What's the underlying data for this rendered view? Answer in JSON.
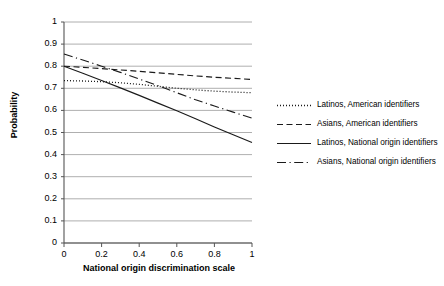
{
  "chart_data": {
    "type": "line",
    "title": "",
    "xlabel": "National origin discrimination scale",
    "ylabel": "Probability",
    "xlim": [
      0,
      1
    ],
    "ylim": [
      0,
      1
    ],
    "grid": "horizontal",
    "legend_position": "right",
    "xticks": [
      "0",
      "0.2",
      "0.4",
      "0.6",
      "0.8",
      "1"
    ],
    "xtick_values": [
      0,
      0.2,
      0.4,
      0.6,
      0.8,
      1
    ],
    "yticks": [
      "0",
      "0.1",
      "0.2",
      "0.3",
      "0.4",
      "0.5",
      "0.6",
      "0.7",
      "0.8",
      "0.9",
      "1"
    ],
    "ytick_values": [
      0,
      0.1,
      0.2,
      0.3,
      0.4,
      0.5,
      0.6,
      0.7,
      0.8,
      0.9,
      1
    ],
    "x": [
      0,
      0.1,
      0.2,
      0.3,
      0.4,
      0.5,
      0.6,
      0.7,
      0.8,
      0.9,
      1
    ],
    "series": [
      {
        "name": "Latinos, American identifiers",
        "style": "dotted",
        "values": [
          0.735,
          0.733,
          0.73,
          0.725,
          0.718,
          0.709,
          0.7,
          0.693,
          0.687,
          0.683,
          0.68
        ]
      },
      {
        "name": "Asians, American identifiers",
        "style": "dashed",
        "values": [
          0.8,
          0.795,
          0.789,
          0.783,
          0.777,
          0.77,
          0.763,
          0.756,
          0.75,
          0.745,
          0.74
        ]
      },
      {
        "name": "Latinos, National origin identifiers",
        "style": "solid",
        "values": [
          0.8,
          0.768,
          0.735,
          0.702,
          0.668,
          0.633,
          0.598,
          0.562,
          0.525,
          0.49,
          0.455
        ]
      },
      {
        "name": "Asians, National origin identifiers",
        "style": "dash-dot",
        "values": [
          0.855,
          0.828,
          0.8,
          0.772,
          0.742,
          0.712,
          0.68,
          0.648,
          0.62,
          0.592,
          0.565
        ]
      }
    ]
  },
  "legend": {
    "entries": [
      {
        "label": "Latinos, American identifiers"
      },
      {
        "label": "Asians, American identifiers"
      },
      {
        "label": "Latinos, National origin identifiers"
      },
      {
        "label": "Asians, National origin identifiers"
      }
    ]
  },
  "axes": {
    "ylabel": "Probability",
    "xlabel": "National origin discrimination scale"
  }
}
